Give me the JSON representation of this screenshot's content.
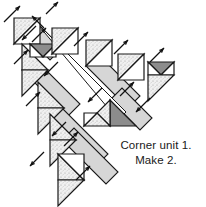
{
  "figure": {
    "type": "quilt-block-piecing-diagram",
    "caption": {
      "line1": "Corner unit 1.",
      "line2": "Make 2."
    }
  },
  "colors": {
    "background": "#ffffff",
    "outline": "#1a1a1a",
    "sash_fill": "#d2d2d2",
    "sash_fill_light": "#dcdcdc",
    "triangle_light": "#f2f2f2",
    "triangle_speckle": "#e8e8e8",
    "triangle_dark": "#8c8c8c",
    "triangle_white": "#ffffff",
    "arrow": "#111111",
    "text": "#1a1a1a"
  },
  "legend": {
    "arrow_meaning": "pressing direction",
    "dark_patch_meaning": "accent fabric",
    "speckle_patch_meaning": "print fabric",
    "plain_patch_meaning": "background fabric"
  },
  "geometry": {
    "view_width": 206,
    "view_height": 207,
    "sash_width": 17,
    "unit_size": 26,
    "diagonal_angle_deg": 45
  },
  "rows": [
    {
      "id": "row-1",
      "name": "top-left corner triangle row",
      "units": [
        {
          "id": "u1",
          "fill": "speckle",
          "label": "half-square-triangle"
        }
      ]
    },
    {
      "id": "row-2",
      "name": "second diagonal row",
      "units": [
        {
          "id": "u2",
          "fill": "speckle",
          "label": "half-square-triangle"
        },
        {
          "id": "u3",
          "fill": "dark",
          "label": "accent-triangle"
        }
      ]
    },
    {
      "id": "row-3",
      "name": "third diagonal row",
      "units": [
        {
          "id": "u4",
          "fill": "speckle",
          "label": "half-square-triangle"
        },
        {
          "id": "u5",
          "fill": "plain",
          "label": "background-triangle"
        }
      ]
    },
    {
      "id": "row-4",
      "name": "fourth diagonal row",
      "units": [
        {
          "id": "u6",
          "fill": "speckle",
          "label": "half-square-triangle"
        },
        {
          "id": "u7",
          "fill": "dark",
          "label": "accent-triangle"
        }
      ]
    },
    {
      "id": "row-5",
      "name": "bottom diagonal row",
      "units": [
        {
          "id": "u8",
          "fill": "speckle",
          "label": "half-square-triangle"
        },
        {
          "id": "u9",
          "fill": "plain",
          "label": "background-triangle"
        }
      ]
    }
  ],
  "sashes": [
    {
      "id": "sash-1",
      "name": "short sash upper-left"
    },
    {
      "id": "sash-2",
      "name": "sash row two"
    },
    {
      "id": "sash-3",
      "name": "sash row three"
    },
    {
      "id": "sash-4",
      "name": "sash row four"
    },
    {
      "id": "sash-5",
      "name": "long center sash"
    },
    {
      "id": "sash-6",
      "name": "lower sash"
    },
    {
      "id": "sash-7",
      "name": "center diagonal spine"
    }
  ],
  "arrows": [
    {
      "id": "arrow-1",
      "direction": "up-right"
    },
    {
      "id": "arrow-2",
      "direction": "up-right"
    },
    {
      "id": "arrow-3",
      "direction": "up-right"
    },
    {
      "id": "arrow-4",
      "direction": "up-right"
    },
    {
      "id": "arrow-5",
      "direction": "up-right"
    },
    {
      "id": "arrow-6",
      "direction": "up-right"
    },
    {
      "id": "arrow-7",
      "direction": "up-right"
    },
    {
      "id": "arrow-8",
      "direction": "up-right"
    },
    {
      "id": "arrow-9",
      "direction": "up-right"
    },
    {
      "id": "arrow-10",
      "direction": "up-right"
    },
    {
      "id": "arrow-11",
      "direction": "down-left"
    },
    {
      "id": "arrow-12",
      "direction": "down-left"
    },
    {
      "id": "arrow-13",
      "direction": "down-left"
    },
    {
      "id": "arrow-14",
      "direction": "down-left"
    },
    {
      "id": "arrow-15",
      "direction": "down-left"
    },
    {
      "id": "arrow-16",
      "direction": "down-left"
    }
  ]
}
